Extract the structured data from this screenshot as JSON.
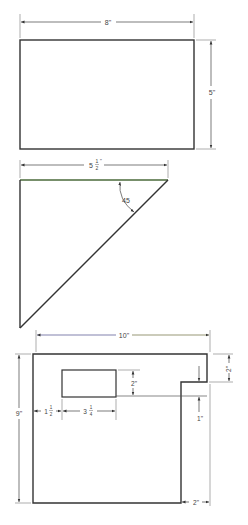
{
  "figures": [
    {
      "id": "rectangle",
      "shape": "rectangle",
      "dimensions": {
        "width_label": "8\"",
        "height_label": "5\""
      }
    },
    {
      "id": "right-triangle",
      "shape": "right-triangle",
      "dimensions": {
        "base_label_whole": "5",
        "base_label_num": "1",
        "base_label_den": "2",
        "base_label_unit": "\"",
        "angle_label": "45"
      }
    },
    {
      "id": "notched-plate",
      "shape": "plate-with-notch-and-cutout",
      "dimensions": {
        "width_label": "10\"",
        "height_label": "9\"",
        "notch_height_label": "2\"",
        "notch_width_label": "2\"",
        "cutout_height_label": "2\"",
        "cutout_offset_whole": "1",
        "cutout_offset_num": "1",
        "cutout_offset_den": "2",
        "cutout_width_whole": "3",
        "cutout_width_num": "1",
        "cutout_width_den": "4",
        "cutout_gap_label": "1\""
      }
    }
  ],
  "colors": {
    "line": "#333333",
    "dim": "#555555",
    "triangle_top": "#4a6a3a",
    "dim_blue": "#4a4a8a"
  }
}
